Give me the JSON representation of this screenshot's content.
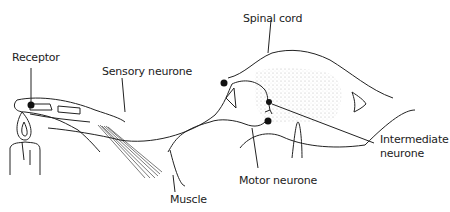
{
  "diagram": {
    "labels": {
      "receptor": "Receptor",
      "sensory_neurone": "Sensory neurone",
      "spinal_cord": "Spinal cord",
      "intermediate_line1": "Intermediate",
      "intermediate_line2": "neurone",
      "motor_neurone": "Motor neurone",
      "muscle": "Muscle"
    },
    "colors": {
      "line": "#222222",
      "dots": "#111111",
      "grey_matter_stipple": "#bbbbbb"
    }
  }
}
